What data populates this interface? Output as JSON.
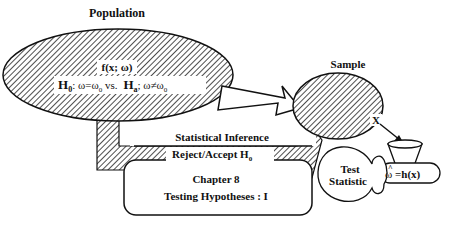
{
  "diagram": {
    "population": {
      "title": "Population",
      "function": "f(x; ω)",
      "h0_label": "H",
      "h0_sub": "0",
      "h0_expr": ":  ω=ω",
      "h0_expr_sub": "0",
      "vs": " vs.",
      "ha_label": "H",
      "ha_sub": "a",
      "ha_expr": ";  ω≠ω",
      "ha_expr_sub": "0"
    },
    "sample": {
      "title": "Sample",
      "x_label": "X"
    },
    "inference_arrow": {
      "label": "Statistical Inference"
    },
    "decision": {
      "label": "Reject/Accept H",
      "sub": "0"
    },
    "chapter": {
      "line1": "Chapter 8",
      "line2": "Testing Hypotheses : I"
    },
    "test_statistic": {
      "line1": "Test",
      "line2": "Statistic"
    },
    "estimator": {
      "hat": "^",
      "symbol": "ω",
      "expr": " =h(x)"
    },
    "colors": {
      "stroke": "#111111",
      "fill": "#ffffff",
      "hatch": "#222222"
    }
  }
}
